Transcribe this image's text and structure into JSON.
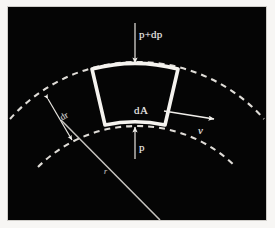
{
  "figure": {
    "kind": "fluid-element-pressure-diagram",
    "background_color": "#050505",
    "line_color": "#f2f0ec",
    "paper_color": "#f7f6f4",
    "labels": {
      "pressure_outer": "p+dp",
      "pressure_inner": "p",
      "area": "dA",
      "velocity": "v",
      "radial_thickness": "dr",
      "radius": "r"
    },
    "annotations": [
      {
        "name": "pressure-outer-arrow",
        "label": "p+dp",
        "direction": "down",
        "description": "pressure acting on the outer face of the element"
      },
      {
        "name": "pressure-inner-arrow",
        "label": "p",
        "direction": "up",
        "description": "pressure acting on the inner face of the element"
      },
      {
        "name": "velocity-arrow",
        "label": "v",
        "direction": "right",
        "description": "tangential velocity of the fluid element"
      },
      {
        "name": "radial-thickness-dimension",
        "label": "dr",
        "direction": "double",
        "description": "radial thickness between the two dashed arcs"
      },
      {
        "name": "radius-line",
        "label": "r",
        "direction": "none",
        "description": "radius from the centre of curvature to the element"
      }
    ],
    "element": {
      "name": "fluid-element",
      "label": "dA",
      "shape": "curved-trapezoid"
    },
    "arcs": [
      {
        "name": "outer-arc",
        "style": "dashed"
      },
      {
        "name": "inner-arc",
        "style": "dashed"
      }
    ]
  }
}
